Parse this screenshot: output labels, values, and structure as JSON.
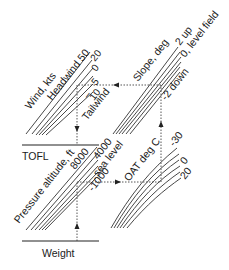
{
  "diagram": {
    "type": "takeoff-field-length-nomogram",
    "baselines": {
      "tofl": "TOFL",
      "weight": "Weight"
    },
    "wind_panel": {
      "axis_label": "Wind, kts",
      "headwind_label": "Headwind 50",
      "tailwind_label": "Tailwind",
      "lines": [
        "50",
        "20",
        "0",
        "5",
        "10"
      ],
      "line_labels": {
        "l20": "20",
        "l0": "0",
        "l5": "5",
        "l10": "10"
      }
    },
    "slope_panel": {
      "axis_label": "Slope, deg",
      "line_labels": {
        "up": "2 up",
        "level": "0, level field",
        "down": "-2 down"
      }
    },
    "altitude_panel": {
      "axis_label": "Pressure altitude, ft",
      "line_labels": {
        "a8000": "8000",
        "a4000": "4000",
        "sea": "sea level",
        "neg1000": "-1000"
      }
    },
    "oat_panel": {
      "axis_label": "OAT deg C",
      "line_labels": {
        "m30": "-30",
        "zero": "0",
        "p20": "20"
      }
    },
    "guide_path": {
      "description": "Dashed reading path: up from Weight through Pressure altitude, right to OAT, up to Slope, left to Wind, down to TOFL"
    }
  }
}
